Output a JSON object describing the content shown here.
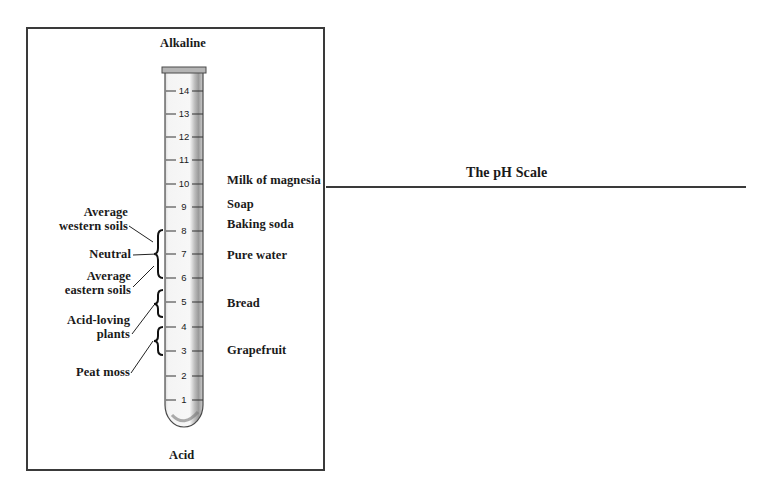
{
  "diagram": {
    "title": "The pH Scale",
    "top_label": "Alkaline",
    "bottom_label": "Acid",
    "scale_ticks": [
      "14",
      "13",
      "12",
      "11",
      "10",
      "9",
      "8",
      "7",
      "6",
      "5",
      "4",
      "3",
      "2",
      "1"
    ],
    "right_labels": [
      {
        "text": "Milk of magnesia",
        "ph": 10
      },
      {
        "text": "Soap",
        "ph": 9
      },
      {
        "text": "Baking soda",
        "ph": 8
      },
      {
        "text": "Pure water",
        "ph": 7
      },
      {
        "text": "Bread",
        "ph": 5
      },
      {
        "text": "Grapefruit",
        "ph": 3
      }
    ],
    "left_labels": [
      {
        "line1": "Average",
        "line2": "western soils",
        "range": "7-8"
      },
      {
        "line1": "Neutral",
        "ph": 7
      },
      {
        "line1": "Average",
        "line2": "eastern soils",
        "range": "6-7"
      },
      {
        "line1": "Acid-loving",
        "line2": "plants",
        "range": "4.5-5.5"
      },
      {
        "line1": "Peat moss",
        "range": "3-4"
      }
    ]
  }
}
